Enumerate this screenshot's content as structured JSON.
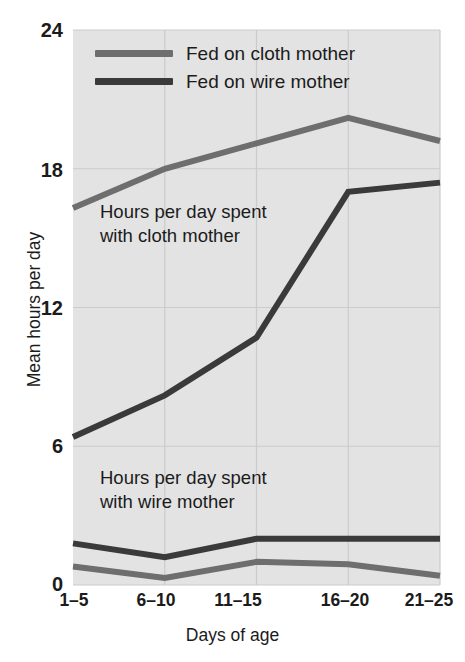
{
  "chart_data": {
    "type": "line",
    "title": "",
    "xlabel": "Days of age",
    "ylabel": "Mean hours per day",
    "categories": [
      "1–5",
      "6–10",
      "11–15",
      "16–20",
      "21–25"
    ],
    "ylim": [
      0,
      24
    ],
    "yticks": [
      0,
      6,
      12,
      18,
      24
    ],
    "ytick_labels": [
      "0",
      "6",
      "12",
      "18",
      "24"
    ],
    "grid": true,
    "legend_position": "top-left-inside",
    "series": [
      {
        "name": "Fed on cloth mother",
        "group": "time with cloth mother",
        "color": "#6e6e6e",
        "values": [
          16.3,
          18.0,
          19.1,
          20.2,
          19.2
        ]
      },
      {
        "name": "Fed on wire mother",
        "group": "time with cloth mother",
        "color": "#3a3a3a",
        "values": [
          6.4,
          8.2,
          10.7,
          17.0,
          17.4
        ]
      },
      {
        "name": "Fed on wire mother",
        "group": "time with wire mother",
        "color": "#3a3a3a",
        "values": [
          1.8,
          1.2,
          2.0,
          2.0,
          2.0
        ]
      },
      {
        "name": "Fed on cloth mother",
        "group": "time with wire mother",
        "color": "#6e6e6e",
        "values": [
          0.8,
          0.3,
          1.0,
          0.9,
          0.4
        ]
      }
    ],
    "annotations": [
      {
        "id": "cloth",
        "text": "Hours per day spent\nwith cloth mother",
        "x_category": "6–10",
        "y_value": 14.6
      },
      {
        "id": "wire",
        "text": "Hours per day spent\nwith wire mother",
        "x_category": "6–10",
        "y_value": 4.0
      }
    ]
  },
  "legend": {
    "items": [
      {
        "label": "Fed on cloth mother",
        "color": "#6e6e6e"
      },
      {
        "label": "Fed on wire mother",
        "color": "#3a3a3a"
      }
    ]
  },
  "axes": {
    "y_title": "Mean hours per day",
    "x_title": "Days of age",
    "y_ticks": [
      "24",
      "18",
      "12",
      "6",
      "0"
    ],
    "x_ticks": [
      "1–5",
      "6–10",
      "11–15",
      "16–20",
      "21–25"
    ]
  },
  "annotations": {
    "cloth": "Hours per day spent\nwith cloth mother",
    "wire": "Hours per day spent\nwith wire mother"
  },
  "colors": {
    "plot_background": "#e3e3e3",
    "grid": "#cbcbcb",
    "cloth_line": "#6e6e6e",
    "wire_line": "#3a3a3a",
    "text": "#1b1b1b"
  }
}
